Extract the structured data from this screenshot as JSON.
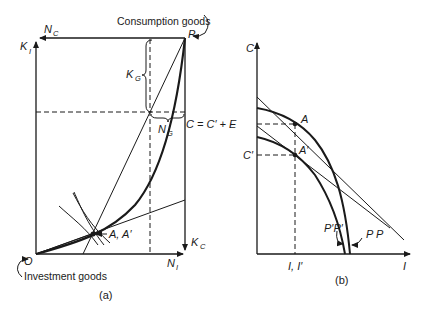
{
  "figure": {
    "panel_a": {
      "caption": "(a)",
      "labels": {
        "consumption_goods": "Consumption goods",
        "investment_goods": "Investment goods",
        "P": "P",
        "O": "O",
        "N_C": "N",
        "N_C_sub": "C",
        "K_I": "K",
        "K_I_sub": "I",
        "K_G": "K",
        "K_G_sub": "G",
        "N_G": "N",
        "N_G_sub": "G",
        "K_C": "K",
        "K_C_sub": "C",
        "N_I": "N",
        "N_I_sub": "I",
        "A_Aprime": "A, A′"
      }
    },
    "panel_b": {
      "caption": "(b)",
      "labels": {
        "C_axis": "C",
        "I_axis": "I",
        "C_eq": "C = C′ + E",
        "C_prime": "C′",
        "A": "A",
        "A_prime": "A′",
        "I_Iprime": "I, I′",
        "PP": "P P",
        "PprimePprime": "P′P′"
      }
    }
  },
  "colors": {
    "ink": "#1a1a1a",
    "background": "#ffffff"
  }
}
